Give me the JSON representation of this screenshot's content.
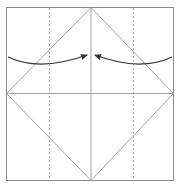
{
  "diagram": {
    "type": "origami-fold-diagram",
    "colors": {
      "background": "#ffffff",
      "paper_edge": "#8a8a8a",
      "crease": "#9a9a9a",
      "dashed_guide": "#a0a0a0",
      "arrow": "#333333"
    },
    "paper": {
      "x": 6,
      "y": 7,
      "width": 167,
      "height": 173
    },
    "creases": [
      {
        "name": "center-vertical",
        "x1": 91,
        "y1": 7,
        "x2": 91,
        "y2": 180
      },
      {
        "name": "center-horizontal",
        "x1": 6,
        "y1": 93,
        "x2": 173,
        "y2": 93
      },
      {
        "name": "diamond-top-left",
        "x1": 91,
        "y1": 7,
        "x2": 6,
        "y2": 93
      },
      {
        "name": "diamond-top-right",
        "x1": 91,
        "y1": 7,
        "x2": 173,
        "y2": 93
      },
      {
        "name": "diamond-bottom-left",
        "x1": 6,
        "y1": 93,
        "x2": 91,
        "y2": 180
      },
      {
        "name": "diamond-bottom-right",
        "x1": 173,
        "y1": 93,
        "x2": 91,
        "y2": 180
      }
    ],
    "dashed_guides": [
      {
        "name": "left-valley-fold",
        "x": 49
      },
      {
        "name": "right-valley-fold",
        "x": 133
      }
    ],
    "arrows": [
      {
        "name": "left-fold-arrow",
        "direction": "left-to-center"
      },
      {
        "name": "right-fold-arrow",
        "direction": "right-to-center"
      }
    ]
  }
}
